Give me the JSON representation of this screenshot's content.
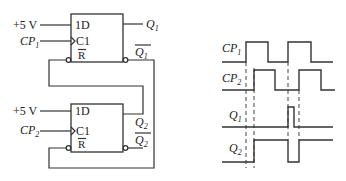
{
  "circuit": {
    "ff1": {
      "supply_label": "+5 V",
      "clock_label": "CP",
      "clock_sub": "1",
      "d_pin": "1D",
      "c_pin": "C1",
      "r_pin": "R",
      "q_label": "Q",
      "q_sub": "1",
      "qbar_label": "Q",
      "qbar_sub": "1"
    },
    "ff2": {
      "supply_label": "+5 V",
      "clock_label": "CP",
      "clock_sub": "2",
      "d_pin": "1D",
      "c_pin": "C1",
      "r_pin": "R",
      "q_label": "Q",
      "q_sub": "2",
      "qbar_label": "Q",
      "qbar_sub": "2"
    }
  },
  "timing": {
    "signals": [
      {
        "label": "CP",
        "sub": "1"
      },
      {
        "label": "CP",
        "sub": "2"
      },
      {
        "label": "Q",
        "sub": "1"
      },
      {
        "label": "Q",
        "sub": "2"
      }
    ]
  },
  "colors": {
    "line": "#333333",
    "background": "#ffffff"
  }
}
